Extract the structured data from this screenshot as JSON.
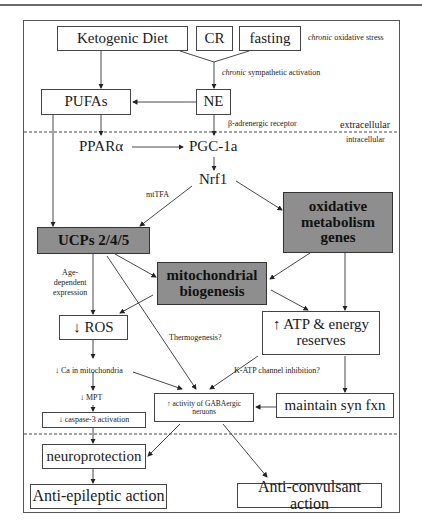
{
  "boxes": {
    "ketogenic_diet": "Ketogenic Diet",
    "cr": "CR",
    "fasting": "fasting",
    "pufas": "PUFAs",
    "ne": "NE",
    "ucps": "UCPs 2/4/5",
    "oxidative_genes": "oxidative metabolism genes",
    "mito_biogenesis": "mitochondrial biogenesis",
    "ros": "↓ ROS",
    "atp": "↑ ATP & energy reserves",
    "gaba": "↑ activity of GABAergic neruons",
    "maintain_syn": "maintain syn fxn",
    "caspase": "↓ caspase-3 activation",
    "neuroprotection": "neuroprotection",
    "anti_epileptic": "Anti-epileptic action",
    "anti_convulsant": "Anti-convulsant action"
  },
  "nodes": {
    "ppar": "PPARα",
    "pgc": "PGC-1a",
    "nrf1": "Nrf1"
  },
  "labels": {
    "chronic_1": "chronic",
    "oxidative_stress": " oxidative stress",
    "chronic_2": "chronic",
    "sympathetic": " sympathetic activation",
    "beta_receptor": "β-adrenergic receptor",
    "extracellular": "extracellular",
    "intracellular": "intracellular",
    "mttfa": "mtTFA",
    "age_dependent": "Age-",
    "age_dependent_2": "dependent",
    "age_dependent_3": "expression",
    "thermogenesis": "Thermogenesis?",
    "katp": "K-ATP channel inhibition?",
    "ca_mito": "↓ Ca in mitochondria",
    "mpt": "↓ MPT"
  },
  "colors": {
    "gray_box": "#8e8e8e",
    "line": "#333333",
    "background": "#ffffff"
  }
}
